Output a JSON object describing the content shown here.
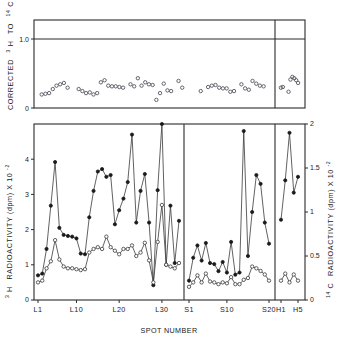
{
  "figure": {
    "xlabel": "SPOT NUMBER",
    "top_panel": {
      "ylabel_main": "CORRECTED",
      "ylabel_h_sup": "3",
      "ylabel_h": "H",
      "ylabel_to": "TO",
      "ylabel_c_sup": "14",
      "ylabel_c": "C",
      "ylabel_ratio": "RATIO",
      "yticks": [
        "0",
        "1.0"
      ]
    },
    "main_panel": {
      "ylabel_left_sup": "3",
      "ylabel_left_h": "H",
      "ylabel_left_text": "RADIOACTIVITY (dpm) X 10",
      "ylabel_left_exp": "-2",
      "ylabel_right_sup": "14",
      "ylabel_right_c": "C",
      "ylabel_right_text": "RADIOACTIVITY (dpm) X 10",
      "ylabel_right_exp": "-2",
      "yticks_left": [
        "0",
        "1",
        "2",
        "3",
        "4"
      ],
      "yticks_right": [
        "0",
        "0.5",
        "1",
        "1.5",
        "2"
      ]
    },
    "xticks": [
      "L1",
      "L10",
      "L20",
      "L30",
      "S1",
      "S10",
      "S20",
      "H1",
      "H5"
    ]
  },
  "chart_data": {
    "type": "line",
    "title": "",
    "xlabel": "SPOT NUMBER",
    "panels": [
      {
        "name": "corrected-ratio-panel",
        "ylabel": "CORRECTED 3H TO 14C RATIO",
        "ylim": [
          0,
          1.3
        ],
        "yticks": [
          0,
          1.0
        ],
        "grid": false,
        "hline": 1.0,
        "series": [
          {
            "name": "corrected 3H/14C ratio",
            "marker": "open-circle",
            "connected": false,
            "points": [
              {
                "x": 1,
                "y": 0.2
              },
              {
                "x": 2,
                "y": 0.21
              },
              {
                "x": 3,
                "y": 0.22
              },
              {
                "x": 4,
                "y": 0.28
              },
              {
                "x": 5,
                "y": 0.33
              },
              {
                "x": 6,
                "y": 0.35
              },
              {
                "x": 7,
                "y": 0.37
              },
              {
                "x": 8,
                "y": 0.3
              },
              {
                "x": 11,
                "y": 0.28
              },
              {
                "x": 12,
                "y": 0.25
              },
              {
                "x": 13,
                "y": 0.22
              },
              {
                "x": 14,
                "y": 0.23
              },
              {
                "x": 15,
                "y": 0.2
              },
              {
                "x": 16,
                "y": 0.22
              },
              {
                "x": 17,
                "y": 0.38
              },
              {
                "x": 18,
                "y": 0.41
              },
              {
                "x": 19,
                "y": 0.33
              },
              {
                "x": 20,
                "y": 0.32
              },
              {
                "x": 21,
                "y": 0.32
              },
              {
                "x": 22,
                "y": 0.31
              },
              {
                "x": 23,
                "y": 0.3
              },
              {
                "x": 25,
                "y": 0.35
              },
              {
                "x": 26,
                "y": 0.32
              },
              {
                "x": 27,
                "y": 0.44
              },
              {
                "x": 28,
                "y": 0.33
              },
              {
                "x": 29,
                "y": 0.38
              },
              {
                "x": 30,
                "y": 0.35
              },
              {
                "x": 31,
                "y": 0.34
              },
              {
                "x": 32,
                "y": 0.12
              },
              {
                "x": 33,
                "y": 0.22
              },
              {
                "x": 34,
                "y": 0.36
              },
              {
                "x": 35,
                "y": 0.26
              },
              {
                "x": 36,
                "y": 0.25
              },
              {
                "x": 38,
                "y": 0.4
              },
              {
                "x": 39,
                "y": 0.3
              },
              {
                "x": 44,
                "y": 0.25
              },
              {
                "x": 46,
                "y": 0.31
              },
              {
                "x": 47,
                "y": 0.33
              },
              {
                "x": 48,
                "y": 0.34
              },
              {
                "x": 49,
                "y": 0.3
              },
              {
                "x": 50,
                "y": 0.29
              },
              {
                "x": 51,
                "y": 0.29
              },
              {
                "x": 52,
                "y": 0.24
              },
              {
                "x": 53,
                "y": 0.25
              },
              {
                "x": 55,
                "y": 0.35
              },
              {
                "x": 56,
                "y": 0.29
              },
              {
                "x": 57,
                "y": 0.27
              },
              {
                "x": 58,
                "y": 0.4
              },
              {
                "x": 59,
                "y": 0.36
              },
              {
                "x": 60,
                "y": 0.33
              },
              {
                "x": 61,
                "y": 0.32
              },
              {
                "x": 64,
                "y": 0.3
              },
              {
                "x": 65,
                "y": 0.31
              },
              {
                "x": 68,
                "y": 0.24
              },
              {
                "x": 69,
                "y": 0.42
              },
              {
                "x": 70,
                "y": 0.46
              },
              {
                "x": 71,
                "y": 0.44
              },
              {
                "x": 72,
                "y": 0.41
              },
              {
                "x": 73,
                "y": 0.37
              }
            ]
          }
        ]
      },
      {
        "name": "radioactivity-panel",
        "ylabel_left": "3H RADIOACTIVITY (dpm) X 10-2",
        "ylabel_right": "14C RADIOACTIVITY (dpm) X 10-2",
        "ylim_left": [
          0,
          5
        ],
        "ylim_right": [
          0,
          2
        ],
        "yticks_left": [
          0,
          1,
          2,
          3,
          4
        ],
        "yticks_right": [
          0,
          0.5,
          1,
          1.5,
          2
        ],
        "grid": false,
        "series": [
          {
            "name": "3H radioactivity",
            "marker": "filled-circle",
            "axis": "left",
            "values": [
              0.7,
              0.75,
              1.45,
              2.68,
              3.92,
              2.05,
              1.85,
              1.82,
              1.8,
              1.75,
              1.32,
              1.3,
              2.35,
              3.1,
              3.65,
              3.72,
              3.5,
              3.55,
              2.15,
              2.55,
              2.88,
              3.35,
              4.7,
              2.2,
              3.1,
              3.58,
              2.2,
              0.42,
              3.12,
              5.0,
              1.0,
              2.68,
              1.05,
              2.25
            ]
          },
          {
            "name": "14C radioactivity",
            "marker": "open-circle",
            "axis": "right",
            "values": [
              0.2,
              0.22,
              0.36,
              0.44,
              0.68,
              0.46,
              0.38,
              0.36,
              0.36,
              0.35,
              0.34,
              0.35,
              0.54,
              0.58,
              0.6,
              0.58,
              0.72,
              0.6,
              0.56,
              0.52,
              0.58,
              0.58,
              0.62,
              0.5,
              0.54,
              0.65,
              0.45,
              0.2,
              0.66,
              1.08,
              0.4,
              0.38,
              0.36,
              0.42
            ]
          }
        ],
        "sections": [
          {
            "label": "L",
            "ticks": [
              "L1",
              "L10",
              "L20",
              "L30"
            ]
          },
          {
            "label": "S",
            "ticks": [
              "S1",
              "S10",
              "S20"
            ]
          },
          {
            "label": "H",
            "ticks": [
              "H1",
              "H5"
            ]
          }
        ],
        "s_section": {
          "3H": [
            0.55,
            1.2,
            1.55,
            1.12,
            1.62,
            1.05,
            1.02,
            0.82,
            1.08,
            0.78,
            1.65,
            0.72,
            0.78,
            4.8,
            1.25,
            2.5,
            3.55,
            3.3,
            2.2,
            1.6
          ],
          "14C": [
            0.15,
            0.2,
            0.28,
            0.2,
            0.3,
            0.21,
            0.2,
            0.18,
            0.2,
            0.19,
            0.26,
            0.18,
            0.18,
            0.23,
            0.25,
            0.38,
            0.36,
            0.33,
            0.29,
            0.22
          ]
        },
        "h_section": {
          "3H": [
            2.28,
            3.4,
            4.75,
            3.05,
            3.5
          ],
          "14C": [
            0.22,
            0.3,
            0.2,
            0.29,
            0.22
          ]
        }
      }
    ]
  }
}
